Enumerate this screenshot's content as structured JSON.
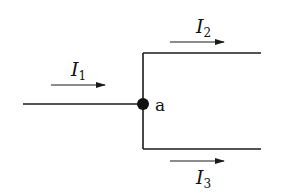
{
  "diagram": {
    "type": "circuit-junction",
    "node": {
      "label": "a"
    },
    "currents": [
      {
        "symbol": "I",
        "subscript": "1",
        "direction": "right",
        "branch": "input"
      },
      {
        "symbol": "I",
        "subscript": "2",
        "direction": "right",
        "branch": "upper-output"
      },
      {
        "symbol": "I",
        "subscript": "3",
        "direction": "right",
        "branch": "lower-output"
      }
    ],
    "colors": {
      "wire": "#1a1a1a",
      "background": "#ffffff"
    }
  }
}
